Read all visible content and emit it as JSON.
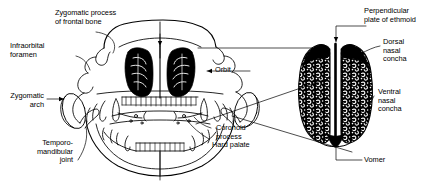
{
  "figure": {
    "ink_color": "#000000",
    "background_color": "#ffffff"
  },
  "labels": {
    "zygomatic_process": "Zygomatic process\nof frontal bone",
    "infraorbital_foramen": "Infraorbital\nforamen",
    "zygomatic_arch": "Zygomatic\narch",
    "temporomandibular_joint": "Temporo-\nmandibular\njoint",
    "orbit": "Orbit",
    "coronoid_process": "Coronoid\nprocess",
    "hard_palate": "Hard palate",
    "perpendicular_plate": "Perpendicular\nplate of ethmoid",
    "dorsal_nasal_concha": "Dorsal\nnasal\nconcha",
    "ventral_nasal_concha": "Ventral\nnasal\nconcha",
    "vomer": "Vomer"
  },
  "views": {
    "left": "rostral-skull-view",
    "right": "transverse-section-view"
  }
}
